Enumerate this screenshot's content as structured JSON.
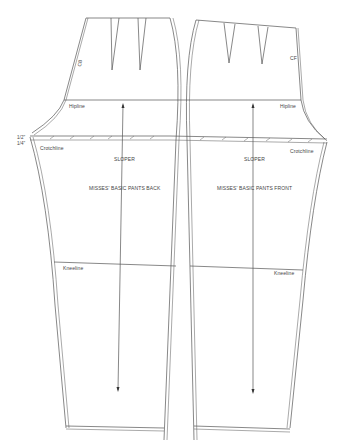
{
  "diagram": {
    "back": {
      "name": "MISSES' BASIC PANTS BACK",
      "sloper": "SLOPER",
      "hipline": "Hipline",
      "crotchline": "Crotchline",
      "kneeline": "Kneeline",
      "center_mark": "CB",
      "seam_allowances": [
        "1/2\"",
        "1/4\""
      ]
    },
    "front": {
      "name": "MISSES' BASIC PANTS FRONT",
      "sloper": "SLOPER",
      "hipline": "Hipline",
      "crotchline": "Crotchline",
      "kneeline": "Kneeline",
      "center_mark": "CF"
    },
    "colors": {
      "line": "#555555",
      "background": "#ffffff"
    }
  }
}
